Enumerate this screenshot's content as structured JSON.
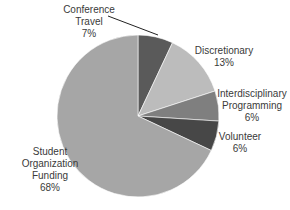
{
  "chart_data": {
    "type": "pie",
    "title": "",
    "start_angle_deg": 0,
    "direction": "clockwise",
    "slices": [
      {
        "label": "Conference Travel",
        "value": 7,
        "pct_label": "7%",
        "color": "#5a5a5a"
      },
      {
        "label": "Discretionary",
        "value": 13,
        "pct_label": "13%",
        "color": "#bcbcbc"
      },
      {
        "label": "Interdisciplinary Programming",
        "value": 6,
        "pct_label": "6%",
        "color": "#7f7f7f"
      },
      {
        "label": "Volunteer",
        "value": 6,
        "pct_label": "6%",
        "color": "#474747"
      },
      {
        "label": "Student Organization Funding",
        "value": 68,
        "pct_label": "68%",
        "color": "#a6a6a6"
      }
    ],
    "legend": "none",
    "data_labels": "outside with category name and percent"
  },
  "labels": {
    "conference": {
      "line1": "Conference",
      "line2": "Travel",
      "pct": "7%"
    },
    "discretionary": {
      "line1": "Discretionary",
      "pct": "13%"
    },
    "interdisciplinary": {
      "line1": "Interdisciplinary",
      "line2": "Programming",
      "pct": "6%"
    },
    "volunteer": {
      "line1": "Volunteer",
      "pct": "6%"
    },
    "student": {
      "line1": "Student",
      "line2": "Organization",
      "line3": "Funding",
      "pct": "68%"
    }
  }
}
